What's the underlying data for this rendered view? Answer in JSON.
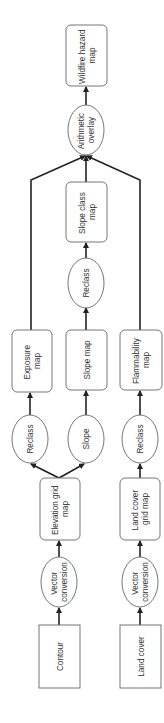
{
  "diagram": {
    "orientation": "rotated-90-ccw",
    "colors": {
      "stroke": "#222222",
      "node_fill": "#ffffff",
      "text": "#333333",
      "box_border": "#666666"
    },
    "nodes": {
      "contour": {
        "lines": [
          "Contour"
        ],
        "shape": "rect"
      },
      "land_cover": {
        "lines": [
          "Land cover"
        ],
        "shape": "rect"
      },
      "vector_conversion_1": {
        "lines": [
          "Vector",
          "conversion"
        ],
        "shape": "ellipse"
      },
      "vector_conversion_2": {
        "lines": [
          "Vector",
          "conversion"
        ],
        "shape": "ellipse"
      },
      "elevation_grid_map": {
        "lines": [
          "Elevation grid",
          "map"
        ],
        "shape": "rounded-rect"
      },
      "land_cover_grid_map": {
        "lines": [
          "Land cover",
          "grid map"
        ],
        "shape": "rounded-rect"
      },
      "reclass_exposure": {
        "lines": [
          "Reclass"
        ],
        "shape": "ellipse"
      },
      "slope": {
        "lines": [
          "Slope"
        ],
        "shape": "ellipse"
      },
      "reclass_flammability": {
        "lines": [
          "Reclass"
        ],
        "shape": "ellipse"
      },
      "exposure_map": {
        "lines": [
          "Exposure",
          "map"
        ],
        "shape": "rounded-rect"
      },
      "slope_map": {
        "lines": [
          "Slope map"
        ],
        "shape": "rounded-rect"
      },
      "flammability_map": {
        "lines": [
          "Flammability",
          "map"
        ],
        "shape": "rounded-rect"
      },
      "reclass_slope": {
        "lines": [
          "Reclass"
        ],
        "shape": "ellipse"
      },
      "slope_class_map": {
        "lines": [
          "Slope class",
          "map"
        ],
        "shape": "rounded-rect"
      },
      "arithmetic_overlay": {
        "lines": [
          "Arithmetic",
          "overlay"
        ],
        "shape": "ellipse"
      },
      "wildfire_hazard_map": {
        "lines": [
          "Wildfire hazard",
          "map"
        ],
        "shape": "rounded-rect"
      }
    },
    "edges": [
      [
        "contour",
        "vector_conversion_1"
      ],
      [
        "vector_conversion_1",
        "elevation_grid_map"
      ],
      [
        "elevation_grid_map",
        "reclass_exposure"
      ],
      [
        "elevation_grid_map",
        "slope"
      ],
      [
        "reclass_exposure",
        "exposure_map"
      ],
      [
        "slope",
        "slope_map"
      ],
      [
        "slope_map",
        "reclass_slope"
      ],
      [
        "reclass_slope",
        "slope_class_map"
      ],
      [
        "land_cover",
        "vector_conversion_2"
      ],
      [
        "vector_conversion_2",
        "land_cover_grid_map"
      ],
      [
        "land_cover_grid_map",
        "reclass_flammability"
      ],
      [
        "reclass_flammability",
        "flammability_map"
      ],
      [
        "exposure_map",
        "arithmetic_overlay"
      ],
      [
        "slope_class_map",
        "arithmetic_overlay"
      ],
      [
        "flammability_map",
        "arithmetic_overlay"
      ],
      [
        "arithmetic_overlay",
        "wildfire_hazard_map"
      ]
    ]
  }
}
